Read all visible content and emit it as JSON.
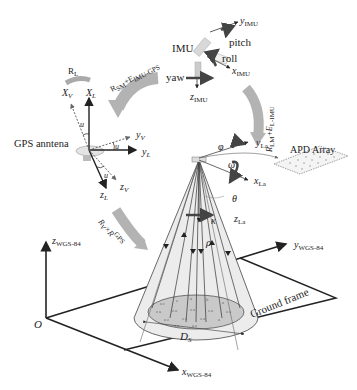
{
  "colors": {
    "line": "#222222",
    "rotation_arrow": "#b0b0b0",
    "cone_fill": "#e6e6e6",
    "footprint_fill": "#c8c8c8",
    "dark_arrow": "#555555",
    "background": "#ffffff"
  },
  "imu": {
    "title": "IMU",
    "pitch": "pitch",
    "roll": "roll",
    "yaw": "yaw",
    "y_axis": "y",
    "y_sub": "IMU",
    "x_axis": "x",
    "x_sub": "IMU",
    "z_axis": "z",
    "z_sub": "IMU"
  },
  "gps": {
    "title": "GPS anntena",
    "xv": "X",
    "xv_sub": "V",
    "xl": "X",
    "xl_sub": "L",
    "yv": "y",
    "yv_sub": "V",
    "yl": "y",
    "yl_sub": "L",
    "zv": "z",
    "zv_sub": "V",
    "zl": "z",
    "zl_sub": "L",
    "angle": "u"
  },
  "transforms": {
    "rl": "R",
    "rl_sub": "L",
    "rsm": "R",
    "rsm_sub": "SM",
    "rsm_plus": "+E",
    "rsm_plus_sub": "IMU-GPS",
    "rlm": "R",
    "rlm_sub": "LM",
    "rlm_plus": "+E",
    "rlm_plus_sub": "L-IMU",
    "rv": "R",
    "rv_sub": "V",
    "rv_times": "×R",
    "rv_sup": "GPS",
    "rv_times_sub": "RI"
  },
  "lidar": {
    "y_axis": "y",
    "y_sub": "La",
    "x_axis": "x",
    "x_sub": "La",
    "z_axis": "z",
    "z_sub": "La",
    "phi": "φ",
    "omega": "ω",
    "theta": "θ",
    "kappa": "κ",
    "rho": "ρ",
    "apd": "APD Array"
  },
  "ground": {
    "origin": "O",
    "z_axis": "z",
    "z_sub": "WGS-84",
    "y_axis": "y",
    "y_sub": "WGS-84",
    "x_axis": "x",
    "x_sub": "WGS-84",
    "frame_label": "Ground frame",
    "diameter": "D",
    "diameter_sub": "S"
  }
}
